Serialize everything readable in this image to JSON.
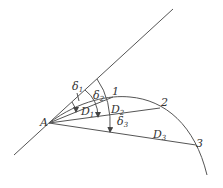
{
  "diagram": {
    "point_A": "A",
    "points": [
      "1",
      "2",
      "3"
    ],
    "chords": [
      {
        "label": "D",
        "sub": "1"
      },
      {
        "label": "D",
        "sub": "2"
      },
      {
        "label": "D",
        "sub": "3"
      }
    ],
    "angles": [
      {
        "label": "δ",
        "sub": "1"
      },
      {
        "label": "δ",
        "sub": "2"
      },
      {
        "label": "δ",
        "sub": "3"
      }
    ],
    "colors": {
      "stroke": "#555555",
      "text": "#333333"
    }
  }
}
